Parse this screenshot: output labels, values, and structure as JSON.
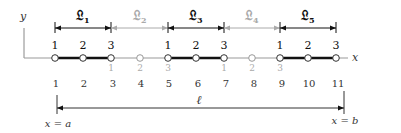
{
  "axes": {
    "x_label": "x",
    "y_label": "y"
  },
  "elements": [
    {
      "label": "𝔏",
      "sub": "1",
      "active": true
    },
    {
      "label": "𝔏",
      "sub": "2",
      "active": false
    },
    {
      "label": "𝔏",
      "sub": "3",
      "active": true
    },
    {
      "label": "𝔏",
      "sub": "4",
      "active": false
    },
    {
      "label": "𝔏",
      "sub": "5",
      "active": true
    }
  ],
  "local_nodes": [
    "1",
    "2",
    "3"
  ],
  "global_nodes": [
    "1",
    "2",
    "3",
    "4",
    "5",
    "6",
    "7",
    "8",
    "9",
    "10",
    "11"
  ],
  "length_label": "ℓ",
  "left_bound": "x = a",
  "right_bound": "x = b",
  "colors": {
    "dark": "#111111",
    "light": "#aaaaaa"
  }
}
